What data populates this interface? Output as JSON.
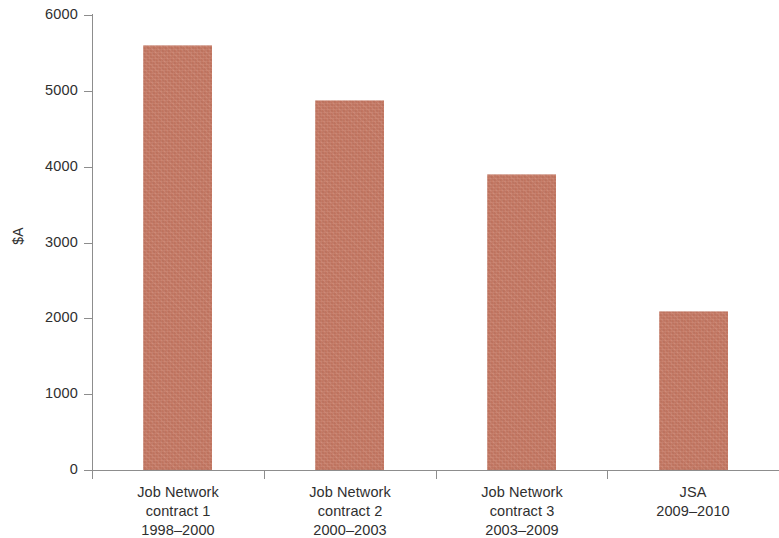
{
  "chart_data": {
    "type": "bar",
    "title": "",
    "subtitle": "",
    "xlabel": "",
    "ylabel": "$A",
    "categories": [
      "Job Network contract 1 1998–2000",
      "Job Network contract 2 2000–2003",
      "Job Network contract 3 2003–2009",
      "JSA 2009–2010"
    ],
    "category_lines": [
      [
        "Job Network",
        "contract 1",
        "1998–2000"
      ],
      [
        "Job Network",
        "contract 2",
        "2000–2003"
      ],
      [
        "Job Network",
        "contract 3",
        "2003–2009"
      ],
      [
        "JSA",
        "2009–2010"
      ]
    ],
    "values": [
      5600,
      4880,
      3900,
      2100
    ],
    "ylim": [
      0,
      6000
    ],
    "ytick_labels": [
      "6000",
      "5000",
      "4000",
      "3000",
      "2000",
      "1000",
      "0"
    ],
    "ytick_values": [
      6000,
      5000,
      4000,
      3000,
      2000,
      1000,
      0
    ],
    "grid": false,
    "legend": false,
    "legend_position": "none",
    "bar_color": "#cb7b65",
    "axis_color": "#8d8d8d",
    "text_color": "#2f2f2f",
    "background_color": "#ffffff"
  }
}
